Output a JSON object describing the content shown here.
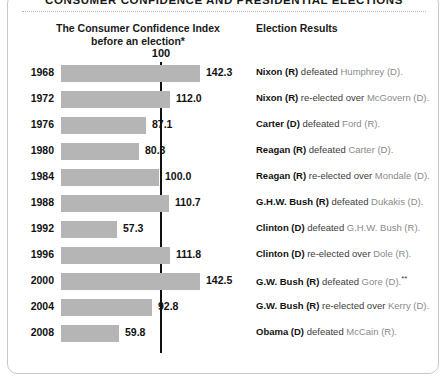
{
  "title": "CONSUMER CONFIDENCE AND PRESIDENTIAL ELECTIONS",
  "headers": {
    "left_line1": "The Consumer Confidence Index",
    "left_line2": "before an election*",
    "right": "Election Results"
  },
  "reference": {
    "label": "100",
    "value": 100
  },
  "colors": {
    "bar": "#b5b5b5",
    "reference_line": "#111111",
    "text": "#111111",
    "dim_text": "#8a8a8a",
    "panel_border": "#c8c8c8"
  },
  "chart_data": {
    "type": "bar",
    "orientation": "horizontal",
    "title": "CONSUMER CONFIDENCE AND PRESIDENTIAL ELECTIONS",
    "xlabel": "The Consumer Confidence Index before an election*",
    "ylabel": "",
    "xlim": [
      0,
      150
    ],
    "grid": false,
    "legend": "none",
    "reference_line": 100,
    "categories": [
      "1968",
      "1972",
      "1976",
      "1980",
      "1984",
      "1988",
      "1992",
      "1996",
      "2000",
      "2004",
      "2008"
    ],
    "values": [
      142.3,
      112.0,
      87.1,
      80.3,
      100.0,
      110.7,
      57.3,
      111.8,
      142.5,
      92.8,
      59.8
    ],
    "value_labels": [
      "142.3",
      "112.0",
      "87.1",
      "80.3",
      "100.0",
      "110.7",
      "57.3",
      "111.8",
      "142.5",
      "92.8",
      "59.8"
    ],
    "annotations": [
      "1968: Nixon (R) defeated Humphrey (D).",
      "1972: Nixon (R) re-elected over McGovern (D).",
      "1976: Carter (D) defeated Ford (R).",
      "1980: Reagan (R) defeated Carter (D).",
      "1984: Reagan (R) re-elected over Mondale (D).",
      "1988: G.H.W. Bush (R) defeated Dukakis (D).",
      "1992: Clinton (D) defeated G.H.W. Bush (R).",
      "1996: Clinton (D) re-elected over Dole (R).",
      "2000: G.W. Bush (R) defeated Gore (D).**",
      "2004: G.W. Bush (R) re-elected over Kerry (D).",
      "2008: Obama (D) defeated McCain (R)."
    ]
  },
  "rows": [
    {
      "year": "1968",
      "value": 142.3,
      "value_label": "142.3",
      "winner": "Nixon (R)",
      "verb": "defeated",
      "loser": "Humphrey (D).",
      "note": ""
    },
    {
      "year": "1972",
      "value": 112.0,
      "value_label": "112.0",
      "winner": "Nixon (R)",
      "verb": "re-elected over",
      "loser": "McGovern (D).",
      "note": ""
    },
    {
      "year": "1976",
      "value": 87.1,
      "value_label": "87.1",
      "winner": "Carter (D)",
      "verb": "defeated",
      "loser": "Ford (R).",
      "note": ""
    },
    {
      "year": "1980",
      "value": 80.3,
      "value_label": "80.3",
      "winner": "Reagan (R)",
      "verb": "defeated",
      "loser": "Carter (D).",
      "note": ""
    },
    {
      "year": "1984",
      "value": 100.0,
      "value_label": "100.0",
      "winner": "Reagan (R)",
      "verb": "re-elected over",
      "loser": "Mondale (D).",
      "note": ""
    },
    {
      "year": "1988",
      "value": 110.7,
      "value_label": "110.7",
      "winner": "G.H.W. Bush (R)",
      "verb": "defeated",
      "loser": "Dukakis (D).",
      "note": ""
    },
    {
      "year": "1992",
      "value": 57.3,
      "value_label": "57.3",
      "winner": "Clinton (D)",
      "verb": "defeated",
      "loser": "G.H.W. Bush (R).",
      "note": ""
    },
    {
      "year": "1996",
      "value": 111.8,
      "value_label": "111.8",
      "winner": "Clinton (D)",
      "verb": "re-elected over",
      "loser": "Dole (R).",
      "note": ""
    },
    {
      "year": "2000",
      "value": 142.5,
      "value_label": "142.5",
      "winner": "G.W. Bush (R)",
      "verb": "defeated",
      "loser": "Gore (D).",
      "note": "**"
    },
    {
      "year": "2004",
      "value": 92.8,
      "value_label": "92.8",
      "winner": "G.W. Bush (R)",
      "verb": "re-elected over",
      "loser": "Kerry (D).",
      "note": ""
    },
    {
      "year": "2008",
      "value": 59.8,
      "value_label": "59.8",
      "winner": "Obama (D)",
      "verb": "defeated",
      "loser": "McCain (R).",
      "note": ""
    }
  ]
}
